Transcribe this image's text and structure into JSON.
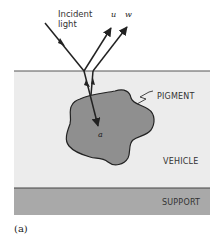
{
  "figure": {
    "incident_label_line1": "Incident",
    "incident_label_line2": "light",
    "ray_u_label": "u",
    "ray_w_label": "w",
    "pigment_label": "PIGMENT",
    "vehicle_label": "VEHICLE",
    "support_label": "SUPPORT",
    "point_label": "a",
    "panel_label": "(a)"
  },
  "colors": {
    "background": "#ffffff",
    "vehicle": "#ececec",
    "support": "#a9a9a9",
    "pigment": "#8f8f8f",
    "lines": "#222222"
  }
}
